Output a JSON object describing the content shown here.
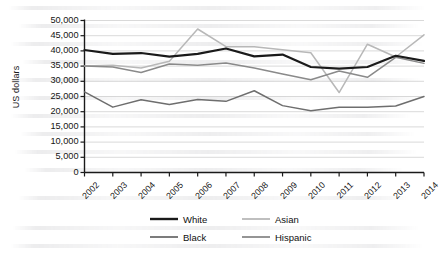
{
  "chart_data": {
    "type": "line",
    "title": "",
    "xlabel": "",
    "ylabel": "US dollars",
    "categories": [
      "2002",
      "2003",
      "2004",
      "2005",
      "2006",
      "2007",
      "2008",
      "2009",
      "2010",
      "2011",
      "2012",
      "2013",
      "2014"
    ],
    "ylim": [
      0,
      50000
    ],
    "ytick_step": 5000,
    "ytick_labels": [
      "50,000",
      "45,000",
      "40,000",
      "35,000",
      "30,000",
      "25,000",
      "20,000",
      "15,000",
      "10,000",
      "5,000",
      "0"
    ],
    "ytick_values": [
      50000,
      45000,
      40000,
      35000,
      30000,
      25000,
      20000,
      15000,
      10000,
      5000,
      0
    ],
    "grid": true,
    "grid_axis": "y",
    "legend_position": "bottom",
    "series": [
      {
        "name": "White",
        "color": "#1a1a1a",
        "width": 2.2,
        "values": [
          40300,
          39000,
          39300,
          38100,
          39000,
          40800,
          38200,
          38800,
          34700,
          34200,
          34700,
          38400,
          36700
        ]
      },
      {
        "name": "Asian",
        "color": "#b8b8b8",
        "width": 1.5,
        "values": [
          35000,
          35300,
          34400,
          36600,
          47200,
          41400,
          41400,
          40400,
          39400,
          26300,
          42200,
          38000,
          45300
        ]
      },
      {
        "name": "Black",
        "color": "#6e6e6e",
        "width": 1.5,
        "values": [
          26500,
          21500,
          23900,
          22400,
          24000,
          23400,
          26900,
          22000,
          20300,
          21500,
          21500,
          21900,
          25000
        ]
      },
      {
        "name": "Hispanic",
        "color": "#8a8a8a",
        "width": 1.5,
        "values": [
          35000,
          34700,
          32900,
          35700,
          35300,
          36000,
          34400,
          32400,
          30500,
          33400,
          31300,
          37900,
          35900
        ]
      }
    ]
  },
  "legend": {
    "entries": [
      {
        "label": "White"
      },
      {
        "label": "Asian"
      },
      {
        "label": "Black"
      },
      {
        "label": "Hispanic"
      }
    ]
  },
  "colors": {
    "white_series": "#1a1a1a",
    "asian_series": "#b8b8b8",
    "black_series": "#6e6e6e",
    "hispanic_series": "#8a8a8a",
    "gridline": "#cfcfcf",
    "axis": "#1a1a1a",
    "background": "#ffffff"
  }
}
